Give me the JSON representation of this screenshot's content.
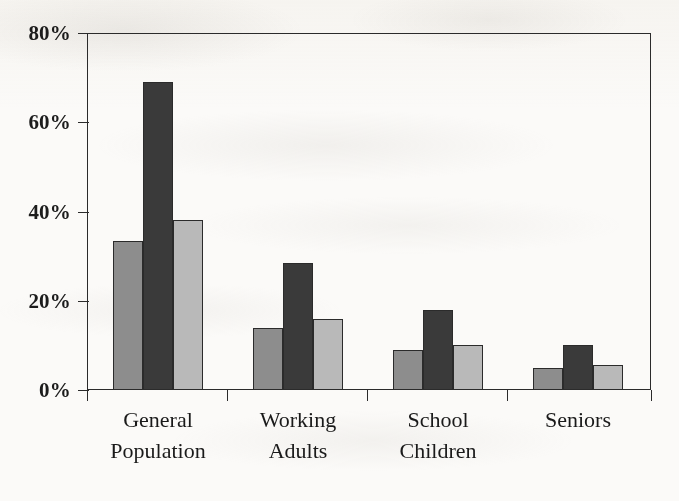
{
  "chart_data": {
    "type": "bar",
    "title": "",
    "subtitle": "",
    "xlabel": "",
    "ylabel": "",
    "categories": [
      "General\nPopulation",
      "Working\nAdults",
      "School\nChildren",
      "Seniors"
    ],
    "series": [
      {
        "name": "series-1",
        "color": "#8d8d8d",
        "values": [
          33.5,
          14,
          9,
          5
        ]
      },
      {
        "name": "series-2",
        "color": "#3a3a3a",
        "values": [
          69,
          28.5,
          18,
          10
        ]
      },
      {
        "name": "series-3",
        "color": "#b9b9b9",
        "values": [
          38,
          16,
          10,
          5.5
        ]
      }
    ],
    "ylim": [
      0,
      80
    ],
    "y_ticks": [
      0,
      20,
      40,
      60,
      80
    ],
    "y_tick_labels": [
      "0%",
      "20%",
      "40%",
      "60%",
      "80%"
    ],
    "grid": false,
    "legend": false,
    "legend_position": "none",
    "annotations": []
  },
  "style": {
    "axis_color": "#2b2b2b",
    "text_color": "#1a1a1a",
    "background": "#fbfaf8"
  }
}
